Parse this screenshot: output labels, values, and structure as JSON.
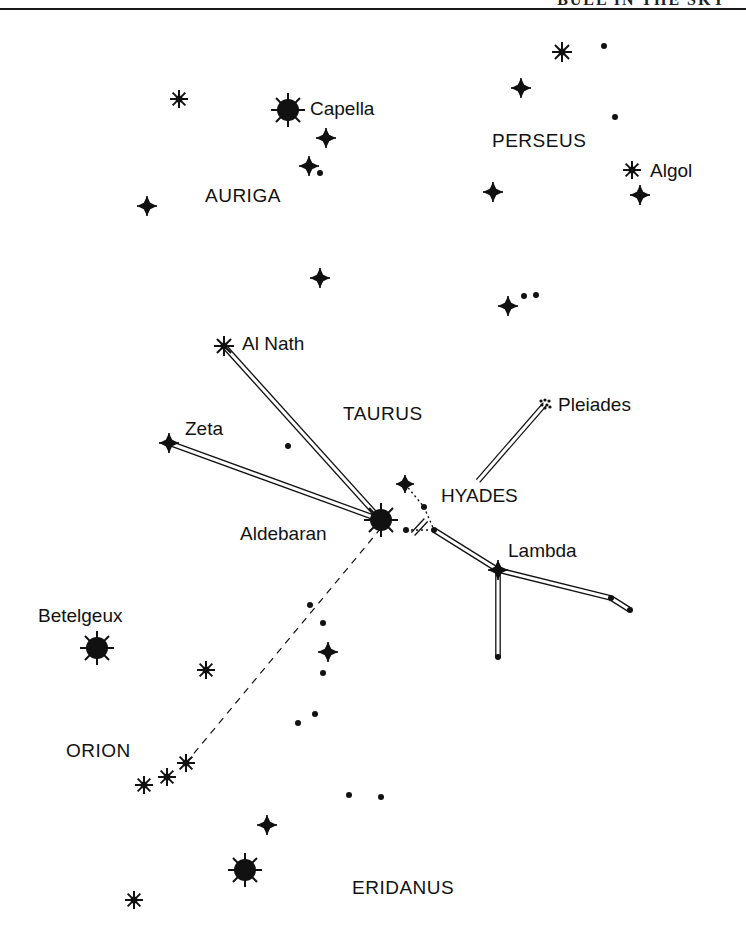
{
  "page": {
    "header_fragment": "BULL IN THE SKY",
    "ink_color": "#111111",
    "background": "#ffffff"
  },
  "constellations": [
    {
      "name": "AURIGA",
      "x": 205,
      "y": 202
    },
    {
      "name": "PERSEUS",
      "x": 492,
      "y": 147
    },
    {
      "name": "TAURUS",
      "x": 343,
      "y": 420
    },
    {
      "name": "ORION",
      "x": 66,
      "y": 757
    },
    {
      "name": "ERIDANUS",
      "x": 352,
      "y": 894
    }
  ],
  "named_stars": [
    {
      "name": "Capella",
      "x": 310,
      "y": 115
    },
    {
      "name": "Algol",
      "x": 650,
      "y": 177
    },
    {
      "name": "Al Nath",
      "x": 242,
      "y": 350
    },
    {
      "name": "Zeta",
      "x": 185,
      "y": 435
    },
    {
      "name": "Pleiades",
      "x": 558,
      "y": 411
    },
    {
      "name": "HYADES",
      "x": 441,
      "y": 502
    },
    {
      "name": "Aldebaran",
      "x": 240,
      "y": 540
    },
    {
      "name": "Lambda",
      "x": 508,
      "y": 557
    },
    {
      "name": "Betelgeux",
      "x": 38,
      "y": 622
    }
  ],
  "stars": {
    "bright": [
      {
        "x": 288,
        "y": 110,
        "r": 11
      },
      {
        "x": 381,
        "y": 520,
        "r": 11
      },
      {
        "x": 97,
        "y": 648,
        "r": 11
      },
      {
        "x": 245,
        "y": 870,
        "r": 11
      }
    ],
    "asterisk": [
      {
        "x": 179,
        "y": 99,
        "s": 9
      },
      {
        "x": 562,
        "y": 52,
        "s": 10
      },
      {
        "x": 632,
        "y": 170,
        "s": 9
      },
      {
        "x": 224,
        "y": 346,
        "s": 10
      },
      {
        "x": 206,
        "y": 670,
        "s": 9
      },
      {
        "x": 186,
        "y": 763,
        "s": 9
      },
      {
        "x": 167,
        "y": 777,
        "s": 9
      },
      {
        "x": 144,
        "y": 785,
        "s": 9
      },
      {
        "x": 134,
        "y": 900,
        "s": 9
      }
    ],
    "cross": [
      {
        "x": 326,
        "y": 138,
        "s": 10
      },
      {
        "x": 309,
        "y": 166,
        "s": 10
      },
      {
        "x": 147,
        "y": 206,
        "s": 10
      },
      {
        "x": 521,
        "y": 88,
        "s": 10
      },
      {
        "x": 640,
        "y": 195,
        "s": 10
      },
      {
        "x": 493,
        "y": 192,
        "s": 10
      },
      {
        "x": 320,
        "y": 278,
        "s": 10
      },
      {
        "x": 508,
        "y": 306,
        "s": 10
      },
      {
        "x": 169,
        "y": 443,
        "s": 10
      },
      {
        "x": 405,
        "y": 484,
        "s": 9
      },
      {
        "x": 498,
        "y": 570,
        "s": 10
      },
      {
        "x": 328,
        "y": 652,
        "s": 10
      },
      {
        "x": 267,
        "y": 825,
        "s": 10
      }
    ],
    "dots": [
      {
        "x": 604,
        "y": 46
      },
      {
        "x": 615,
        "y": 117
      },
      {
        "x": 320,
        "y": 173
      },
      {
        "x": 524,
        "y": 296
      },
      {
        "x": 536,
        "y": 295
      },
      {
        "x": 288,
        "y": 446
      },
      {
        "x": 424,
        "y": 507
      },
      {
        "x": 406,
        "y": 530
      },
      {
        "x": 434,
        "y": 530
      },
      {
        "x": 611,
        "y": 598
      },
      {
        "x": 630,
        "y": 610
      },
      {
        "x": 498,
        "y": 657
      },
      {
        "x": 310,
        "y": 605
      },
      {
        "x": 323,
        "y": 623
      },
      {
        "x": 323,
        "y": 673
      },
      {
        "x": 315,
        "y": 714
      },
      {
        "x": 298,
        "y": 723
      },
      {
        "x": 349,
        "y": 795
      },
      {
        "x": 381,
        "y": 797
      }
    ],
    "pleiades_cluster": {
      "x": 545,
      "y": 404
    }
  },
  "lines": {
    "double": [
      {
        "from": [
          224,
          346
        ],
        "to": [
          381,
          520
        ]
      },
      {
        "from": [
          169,
          443
        ],
        "to": [
          381,
          520
        ]
      },
      {
        "from": [
          545,
          404
        ],
        "to": [
          478,
          481
        ]
      },
      {
        "from": [
          426,
          520
        ],
        "to": [
          413,
          534
        ]
      },
      {
        "from": [
          434,
          530
        ],
        "to": [
          498,
          570
        ]
      },
      {
        "from": [
          498,
          570
        ],
        "to": [
          611,
          598
        ]
      },
      {
        "from": [
          611,
          598
        ],
        "to": [
          630,
          610
        ]
      },
      {
        "from": [
          498,
          570
        ],
        "to": [
          498,
          657
        ]
      }
    ],
    "dashed": [
      {
        "from": [
          381,
          528
        ],
        "to": [
          186,
          763
        ]
      }
    ],
    "dotted": [
      {
        "from": [
          405,
          484
        ],
        "to": [
          424,
          507
        ]
      },
      {
        "from": [
          424,
          507
        ],
        "to": [
          434,
          530
        ]
      },
      {
        "from": [
          406,
          530
        ],
        "to": [
          434,
          530
        ]
      }
    ]
  }
}
